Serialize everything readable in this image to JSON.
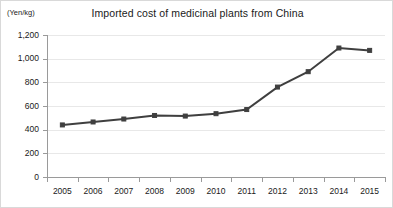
{
  "chart_data": {
    "type": "line",
    "title": "Imported cost of medicinal plants from China",
    "xlabel": "",
    "ylabel": "(Yen/kg)",
    "y_unit_label": "(Yen/kg)",
    "categories": [
      "2005",
      "2006",
      "2007",
      "2008",
      "2009",
      "2010",
      "2011",
      "2012",
      "2013",
      "2014",
      "2015"
    ],
    "values": [
      440,
      465,
      490,
      520,
      515,
      535,
      570,
      760,
      890,
      1090,
      1070
    ],
    "series": [
      {
        "name": "Imported cost",
        "values": [
          440,
          465,
          490,
          520,
          515,
          535,
          570,
          760,
          890,
          1090,
          1070
        ]
      }
    ],
    "ylim": [
      0,
      1200
    ],
    "y_ticks": [
      0,
      200,
      400,
      600,
      800,
      1000,
      1200
    ],
    "y_tick_labels": [
      "0",
      "200",
      "400",
      "600",
      "800",
      "1,000",
      "1,200"
    ],
    "x_tick_labels": [
      "2005",
      "2006",
      "2007",
      "2008",
      "2009",
      "2010",
      "2011",
      "2012",
      "2013",
      "2014",
      "2015"
    ],
    "grid": true,
    "legend": false,
    "legend_position": "none",
    "line_color": "#3f3f3f",
    "grid_color": "#e8e8e8",
    "axis_color": "#9a9a9a",
    "background_color": "#ffffff",
    "border_color": "#d9d9d9"
  }
}
